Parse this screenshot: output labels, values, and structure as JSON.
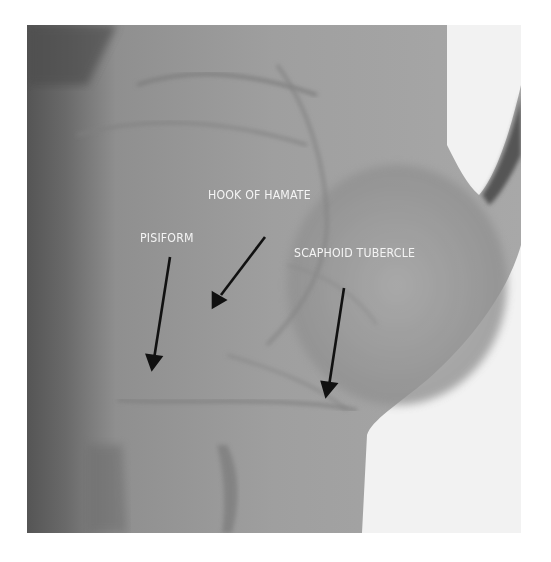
{
  "figure": {
    "labels": [
      {
        "id": "hook-of-hamate",
        "text": "HOOK OF HAMATE"
      },
      {
        "id": "pisiform",
        "text": "PISIFORM"
      },
      {
        "id": "scaphoid-tubercle",
        "text": "SCAPHOID TUBERCLE"
      }
    ],
    "colors": {
      "label_text": "#f4f4f4",
      "arrow": "#111111",
      "background": "#ffffff"
    }
  }
}
